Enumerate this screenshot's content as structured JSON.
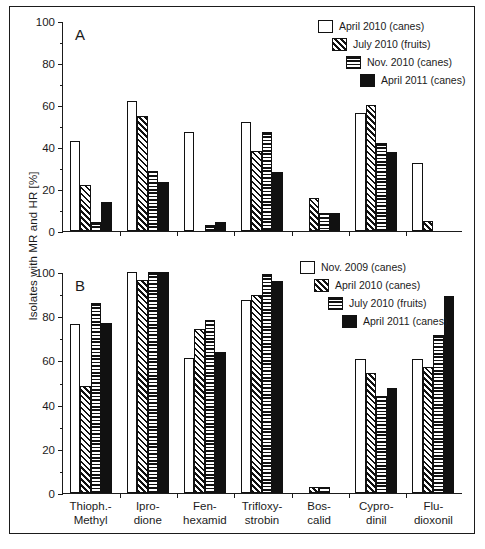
{
  "figure": {
    "ylabel": "Isolates with MR and HR [%]",
    "panel_a_letter": "A",
    "panel_b_letter": "B"
  },
  "chart_data": {
    "type": "bar",
    "title": "",
    "xlabel": "",
    "ylabel": "Isolates with MR and HR [%]",
    "ylim": [
      0,
      100
    ],
    "yticks": [
      0,
      20,
      40,
      60,
      80,
      100
    ],
    "grid": false,
    "legend_position": "top-right",
    "categories": [
      "Thioph.-Methyl",
      "Iprodione",
      "Fenhexamid",
      "Trifloxystrobin",
      "Boscalid",
      "Cyprodinil",
      "Fludioxonil"
    ],
    "panels": [
      {
        "label": "A",
        "series": [
          {
            "name": "April 2010 (canes)",
            "pattern": "open",
            "values": [
              43.0,
              61.8,
              47.2,
              51.8,
              0.0,
              56.2,
              32.3
            ]
          },
          {
            "name": "July 2010 (fruits)",
            "pattern": "diagonal",
            "values": [
              22.0,
              54.7,
              0.0,
              38.2,
              15.5,
              60.2,
              4.8
            ]
          },
          {
            "name": "Nov. 2010 (canes)",
            "pattern": "horizontal",
            "values": [
              4.5,
              28.6,
              3.0,
              47.2,
              8.4,
              42.0,
              0.0
            ]
          },
          {
            "name": "April 2011 (canes)",
            "pattern": "solid",
            "values": [
              14.0,
              23.3,
              4.2,
              28.3,
              8.5,
              37.5,
              0.0
            ]
          }
        ]
      },
      {
        "label": "B",
        "series": [
          {
            "name": "Nov. 2009 (canes)",
            "pattern": "open",
            "values": [
              76.5,
              100.0,
              61.0,
              87.5,
              0.0,
              60.5,
              60.5
            ]
          },
          {
            "name": "April 2010 (canes)",
            "pattern": "diagonal",
            "values": [
              48.5,
              96.5,
              74.0,
              89.5,
              2.5,
              54.5,
              57.0
            ]
          },
          {
            "name": "July 2010 (fruits)",
            "pattern": "horizontal",
            "values": [
              86.0,
              100.0,
              78.5,
              99.2,
              2.5,
              44.0,
              71.5
            ]
          },
          {
            "name": "April 2011 (canes)",
            "pattern": "solid",
            "values": [
              77.0,
              100.0,
              63.8,
              96.0,
              0.0,
              47.5,
              89.0
            ]
          }
        ]
      }
    ],
    "category_lines": [
      [
        "Thioph.-",
        "Methyl"
      ],
      [
        "Ipro-",
        "dione"
      ],
      [
        "Fen-",
        "hexamid"
      ],
      [
        "Trifloxy-",
        "strobin"
      ],
      [
        "Bos-",
        "calid"
      ],
      [
        "Cypro-",
        "dinil"
      ],
      [
        "Flu-",
        "dioxonil"
      ]
    ],
    "colors": {
      "ink": "#111111",
      "background": "#ffffff"
    }
  }
}
